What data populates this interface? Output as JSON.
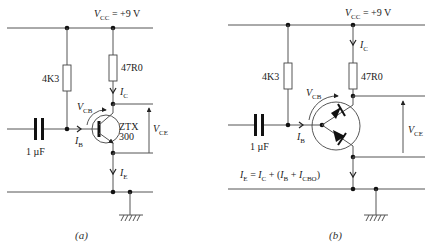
{
  "figure": {
    "panels": [
      {
        "id": "a",
        "caption": "(a)",
        "supply_label": "V",
        "supply_sub": "CC",
        "supply_value": " =  +9 V",
        "base_resistor": "4K3",
        "collector_resistor": "47R0",
        "capacitor": "1 µF",
        "transistor_name": "ZTX",
        "transistor_num": "300",
        "ic_label": "I",
        "ic_sub": "C",
        "ib_label": "I",
        "ib_sub": "B",
        "ie_label": "I",
        "ie_sub": "E",
        "vcb_label": "V",
        "vcb_sub": "CB",
        "vce_label": "V",
        "vce_sub": "CE"
      },
      {
        "id": "b",
        "caption": "(b)",
        "supply_label": "V",
        "supply_sub": "CC",
        "supply_value": " =  +9 V",
        "base_resistor": "4K3",
        "collector_resistor": "47R0",
        "capacitor": "1 µF",
        "ic_label": "I",
        "ic_sub": "C",
        "ib_label": "I",
        "ib_sub": "B",
        "vcb_label": "V",
        "vcb_sub": "CB",
        "vce_label": "V",
        "vce_sub": "CE",
        "equation": {
          "ie": "I",
          "ie_sub": "E",
          "eq": " = ",
          "ic": "I",
          "ic_sub": "C",
          "plus1": " + (",
          "ib": "I",
          "ib_sub": "B",
          "plus2": " + ",
          "icbo": "I",
          "icbo_sub": "CBO",
          "close": ")"
        }
      }
    ]
  }
}
